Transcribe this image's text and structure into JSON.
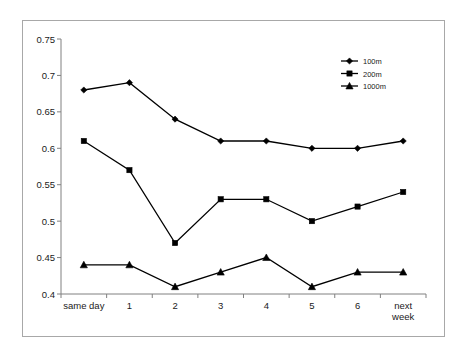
{
  "chart_data": {
    "type": "line",
    "title": "",
    "subtitle": "",
    "xlabel": "",
    "ylabel": "",
    "categories": [
      "same day",
      "1",
      "2",
      "3",
      "4",
      "5",
      "6",
      "next week"
    ],
    "ylim": [
      0.4,
      0.75
    ],
    "ytick_labels": [
      "0.75",
      "0.7",
      "0.65",
      "0.6",
      "0.55",
      "0.5",
      "0.45",
      "0.4"
    ],
    "ytick_values": [
      0.75,
      0.7,
      0.65,
      0.6,
      0.55,
      0.5,
      0.45,
      0.4
    ],
    "grid": false,
    "legend_position": "top-right",
    "series": [
      {
        "name": "100m",
        "marker": "diamond",
        "color": "#000000",
        "values": [
          0.68,
          0.69,
          0.64,
          0.61,
          0.61,
          0.6,
          0.6,
          0.61
        ]
      },
      {
        "name": "200m",
        "marker": "square",
        "color": "#000000",
        "values": [
          0.61,
          0.57,
          0.47,
          0.53,
          0.53,
          0.5,
          0.52,
          0.54
        ]
      },
      {
        "name": "1000m",
        "marker": "triangle",
        "color": "#000000",
        "values": [
          0.44,
          0.44,
          0.41,
          0.43,
          0.45,
          0.41,
          0.43,
          0.43
        ]
      }
    ]
  },
  "legend": {
    "items": [
      {
        "label": "100m"
      },
      {
        "label": "200m"
      },
      {
        "label": "1000m"
      }
    ]
  },
  "axes": {
    "x_tick_labels": [
      "same day",
      "1",
      "2",
      "3",
      "4",
      "5",
      "6",
      "next week"
    ],
    "y_tick_labels": [
      "0.75",
      "0.7",
      "0.65",
      "0.6",
      "0.55",
      "0.5",
      "0.45",
      "0.4"
    ]
  },
  "colors": {
    "frame_border": "#a8a8a8",
    "axis": "#808080",
    "series_stroke": "#000000",
    "text": "#1a1a1a",
    "background": "#ffffff"
  }
}
